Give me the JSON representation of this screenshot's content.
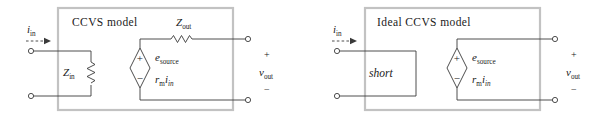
{
  "figure": {
    "caption_present": false,
    "panels": [
      {
        "id": "ccvs-model",
        "title": "CCVS model",
        "input_current_label": {
          "base": "i",
          "sub": "in"
        },
        "input_impedance_label": {
          "base": "Z",
          "sub": "in"
        },
        "output_impedance_label": {
          "base": "Z",
          "sub": "out"
        },
        "source_label": {
          "base": "e",
          "sub": "source"
        },
        "source_value": {
          "base1": "r",
          "sub1": "m",
          "base2": "i",
          "sub2": "in"
        },
        "source_plus": "+",
        "source_minus": "−",
        "output_voltage_label": {
          "base": "v",
          "sub": "out"
        },
        "output_plus": "+",
        "output_minus": "−",
        "has_input_resistor": true,
        "has_output_resistor": true,
        "has_short": false
      },
      {
        "id": "ideal-ccvs-model",
        "title": "Ideal CCVS model",
        "input_current_label": {
          "base": "i",
          "sub": "in"
        },
        "short_label": "short",
        "source_label": {
          "base": "e",
          "sub": "source"
        },
        "source_value": {
          "base1": "r",
          "sub1": "m",
          "base2": "i",
          "sub2": "in"
        },
        "source_plus": "+",
        "source_minus": "−",
        "output_voltage_label": {
          "base": "v",
          "sub": "out"
        },
        "output_plus": "+",
        "output_minus": "−",
        "has_input_resistor": false,
        "has_output_resistor": false,
        "has_short": true
      }
    ]
  },
  "colors": {
    "background": "#ffffff",
    "wire": "#3a3a3a",
    "box_border": "#c2c2c2",
    "text": "#1a1a1a"
  }
}
